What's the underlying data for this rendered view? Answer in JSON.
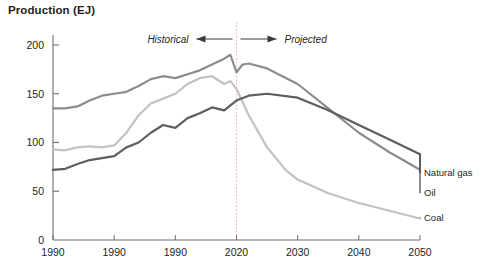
{
  "chart_data": {
    "type": "line",
    "title": "Production (EJ)",
    "xlabel": "",
    "ylabel": "Production (EJ)",
    "xlim": [
      1990,
      2050
    ],
    "ylim": [
      0,
      210
    ],
    "grid": false,
    "legend_position": "right-inline",
    "y_ticks": [
      "0",
      "50",
      "100",
      "150",
      "200"
    ],
    "y_tick_values": [
      0,
      50,
      100,
      150,
      200
    ],
    "x_ticks": [
      "1990",
      "1990",
      "1990",
      "2020",
      "2030",
      "2040",
      "2050"
    ],
    "x_tick_values": [
      1990,
      2000,
      2010,
      2020,
      2030,
      2040,
      2050
    ],
    "annotations": {
      "historical": "Historical",
      "projected": "Projected",
      "divider_year": 2020
    },
    "colors": {
      "oil": "#8c8c8c",
      "coal": "#c2c2c2",
      "natural_gas": "#5e5e5e",
      "divider": "#e8a9a9",
      "axis": "#6d6d6d"
    },
    "series": [
      {
        "name": "Oil",
        "label": "Oil",
        "color": "#8c8c8c",
        "x": [
          1990,
          1992,
          1994,
          1996,
          1998,
          2000,
          2002,
          2004,
          2006,
          2008,
          2010,
          2012,
          2014,
          2016,
          2018,
          2019,
          2020,
          2021,
          2022,
          2025,
          2030,
          2035,
          2040,
          2045,
          2050
        ],
        "values": [
          135,
          135,
          137,
          143,
          148,
          150,
          152,
          158,
          165,
          168,
          166,
          170,
          174,
          180,
          186,
          190,
          172,
          180,
          181,
          176,
          160,
          135,
          110,
          90,
          72
        ]
      },
      {
        "name": "Coal",
        "label": "Coal",
        "color": "#c2c2c2",
        "x": [
          1990,
          1992,
          1994,
          1996,
          1998,
          2000,
          2002,
          2004,
          2006,
          2008,
          2010,
          2012,
          2014,
          2016,
          2018,
          2019,
          2020,
          2022,
          2025,
          2028,
          2030,
          2035,
          2040,
          2045,
          2050
        ],
        "values": [
          93,
          92,
          95,
          96,
          95,
          97,
          110,
          128,
          140,
          145,
          150,
          160,
          166,
          168,
          160,
          163,
          155,
          128,
          95,
          72,
          62,
          48,
          38,
          30,
          22
        ]
      },
      {
        "name": "Natural gas",
        "label": "Natural gas",
        "color": "#5e5e5e",
        "x": [
          1990,
          1992,
          1994,
          1996,
          1998,
          2000,
          2002,
          2004,
          2006,
          2008,
          2010,
          2012,
          2014,
          2016,
          2018,
          2019,
          2020,
          2022,
          2025,
          2030,
          2035,
          2040,
          2045,
          2050
        ],
        "values": [
          72,
          73,
          78,
          82,
          84,
          86,
          95,
          100,
          110,
          118,
          115,
          125,
          130,
          136,
          133,
          138,
          143,
          148,
          150,
          146,
          133,
          118,
          103,
          88
        ]
      }
    ]
  }
}
